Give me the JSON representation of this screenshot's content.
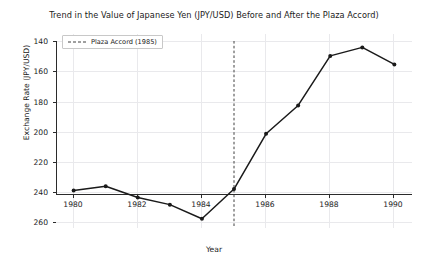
{
  "chart_data": {
    "type": "line",
    "title": "Trend in the Value of Japanese Yen (JPY/USD) Before and After the Plaza Accord)",
    "xlabel": "Year",
    "ylabel": "Exchange Rate (JPY/USD)",
    "x": [
      1980,
      1981,
      1982,
      1983,
      1984,
      1985,
      1986,
      1987,
      1988,
      1989,
      1990
    ],
    "values": [
      240,
      237,
      245,
      250,
      260,
      239,
      200,
      180,
      145,
      139,
      151
    ],
    "series": [
      {
        "name": "Exchange Rate (JPY/USD)",
        "values": [
          240,
          237,
          245,
          250,
          260,
          239,
          200,
          180,
          145,
          139,
          151
        ],
        "color": "#1a1a1a",
        "marker": "circle",
        "linestyle": "solid"
      }
    ],
    "xlim": [
      1979.45,
      1990.55
    ],
    "ylim": [
      266.5,
      134.5
    ],
    "y_axis_inverted": true,
    "xticks": [
      1980,
      1982,
      1984,
      1986,
      1988,
      1990
    ],
    "xtick_labels": [
      "1980",
      "1982",
      "1984",
      "1986",
      "1988",
      "1990"
    ],
    "yticks": [
      140,
      160,
      180,
      200,
      220,
      240,
      260
    ],
    "ytick_labels": [
      "140",
      "160",
      "180",
      "200",
      "220",
      "240",
      "260"
    ],
    "grid": true,
    "grid_axis": "both",
    "grid_color": "#e9e9ec",
    "legend_position": "upper left",
    "annotations": [
      {
        "type": "vertical-line",
        "label": "Plaza Accord (1985)",
        "x": 1985,
        "linestyle": "dashed",
        "color": "#404040"
      }
    ]
  },
  "legend": {
    "entries": [
      {
        "label": "Plaza Accord (1985)",
        "color": "#404040",
        "linestyle": "dashed"
      }
    ]
  }
}
